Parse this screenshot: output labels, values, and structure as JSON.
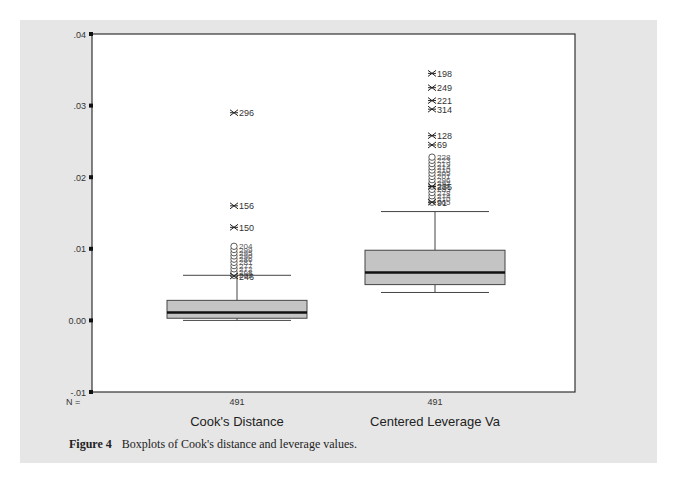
{
  "chart_data": {
    "type": "boxplot",
    "title": "",
    "xlabel": "",
    "ylabel": "",
    "ylim": [
      -0.01,
      0.04
    ],
    "yticks": [
      ".04",
      ".03",
      ".02",
      ".01",
      "0.00",
      "-.01"
    ],
    "ytick_values": [
      0.04,
      0.03,
      0.02,
      0.01,
      0.0,
      -0.01
    ],
    "grid": false,
    "legend": null,
    "n_label": "N =",
    "categories": [
      "Cook's Distance",
      "Centered Leverage Va"
    ],
    "series": [
      {
        "name": "Cook's Distance",
        "n": "491",
        "whisker_low": 0.0,
        "q1": 0.0003,
        "median": 0.0011,
        "q3": 0.0028,
        "whisker_high": 0.0063,
        "outliers_circle_range": [
          0.0063,
          0.0105
        ],
        "extremes": [
          {
            "label": "296",
            "value": 0.029
          },
          {
            "label": "156",
            "value": 0.016
          },
          {
            "label": "150",
            "value": 0.013
          },
          {
            "label": "246",
            "value": 0.0062
          }
        ]
      },
      {
        "name": "Centered Leverage Va",
        "n": "491",
        "whisker_low": 0.0039,
        "q1": 0.005,
        "median": 0.0067,
        "q3": 0.0098,
        "whisker_high": 0.0152,
        "outliers_circle_range": [
          0.0165,
          0.023
        ],
        "extremes": [
          {
            "label": "198",
            "value": 0.0345
          },
          {
            "label": "249",
            "value": 0.0325
          },
          {
            "label": "221",
            "value": 0.0307
          },
          {
            "label": "314",
            "value": 0.0295
          },
          {
            "label": "128",
            "value": 0.0258
          },
          {
            "label": "69",
            "value": 0.0245
          },
          {
            "label": "235",
            "value": 0.0187
          },
          {
            "label": "91",
            "value": 0.0165
          }
        ]
      }
    ]
  },
  "figure": {
    "caption_label": "Figure 4",
    "caption_text": "Boxplots of Cook's distance and leverage values."
  }
}
